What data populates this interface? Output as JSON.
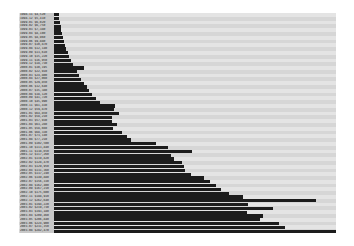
{
  "chart_data": {
    "type": "bar",
    "orientation": "horizontal",
    "title": "",
    "xlabel": "",
    "ylabel": "",
    "grid": false,
    "legend": null,
    "bar_color": "#1c1c1c",
    "stripe_colors": [
      "#e4e4e4",
      "#d6d6d6"
    ],
    "xlim": [
      0,
      282
    ],
    "categories": [
      "1998-11 $4,520",
      "1998-12 $5,410",
      "1999-01 $6,020",
      "1999-02 $6,750",
      "1999-03 $7,380",
      "1999-04 $8,100",
      "1999-05 $8,960",
      "1999-06 $9,880",
      "1999-07 $10,870",
      "1999-08 $12,140",
      "1999-09 $13,610",
      "1999-10 $15,220",
      "1999-11 $16,950",
      "1999-12 $18,730",
      "2000-01 $30,195",
      "2000-02 $22,910",
      "2000-03 $24,800",
      "2000-04 $27,060",
      "2000-05 $29,850",
      "2000-06 $32,640",
      "2000-07 $35,380",
      "2000-08 $38,120",
      "2000-09 $41,720",
      "2000-10 $45,990",
      "2000-11 $61,430",
      "2000-12 $59,870",
      "2001-01 $64,850",
      "2001-02 $58,210",
      "2001-03 $57,930",
      "2001-04 $63,280",
      "2001-05 $58,660",
      "2001-06 $68,330",
      "2001-07 $73,140",
      "2001-08 $77,210",
      "2001-09 $102,500",
      "2001-10 $113,840",
      "2001-11 $138,650",
      "2001-12 $117,260",
      "2002-01 $119,820",
      "2002-02 $128,470",
      "2002-03 $129,950",
      "2002-04 $131,360",
      "2002-05 $137,240",
      "2002-06 $149,880",
      "2002-07 $156,330",
      "2002-08 $162,400",
      "2002-09 $167,210",
      "2002-10 $175,600",
      "2002-11 $188,910",
      "2002-12 $262,640",
      "2003-01 $194,220",
      "2003-02 $219,730",
      "2003-03 $193,180",
      "2003-04 $209,460",
      "2003-05 $206,840",
      "2003-06 $224,900",
      "2003-07 $231,350",
      "2003-08 $282,470"
    ],
    "values": [
      4520,
      5410,
      6020,
      6750,
      7380,
      8100,
      8960,
      9880,
      10870,
      12140,
      13610,
      15220,
      16950,
      18730,
      30195,
      22910,
      24800,
      27060,
      29850,
      32640,
      35380,
      38120,
      41720,
      45990,
      61430,
      59870,
      64850,
      58210,
      57930,
      63280,
      58660,
      68330,
      73140,
      77210,
      102500,
      113840,
      138650,
      117260,
      119820,
      128470,
      129950,
      131360,
      137240,
      149880,
      156330,
      162400,
      167210,
      175600,
      188910,
      262640,
      194220,
      219730,
      193180,
      209460,
      206840,
      224900,
      231350,
      282470
    ],
    "value_max": 282470
  }
}
